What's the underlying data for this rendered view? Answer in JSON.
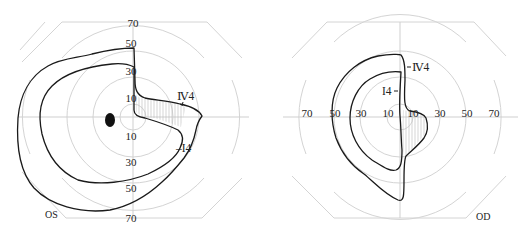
{
  "figure": {
    "type": "Goldmann visual field perimetry",
    "panels": [
      {
        "id": "left",
        "eye_label": "OS",
        "ring_labels_vertical": [
          "70",
          "50",
          "30",
          "10",
          "10",
          "30",
          "50",
          "70"
        ],
        "isopters": [
          {
            "name": "IV4",
            "label": "Ⅳ4"
          },
          {
            "name": "I4",
            "label": "I4"
          }
        ],
        "blind_spot": true
      },
      {
        "id": "right",
        "eye_label": "OD",
        "ring_labels_horizontal": [
          "70",
          "50",
          "30",
          "10",
          "10",
          "30",
          "50",
          "70"
        ],
        "isopters": [
          {
            "name": "IV4",
            "label": "Ⅳ4"
          },
          {
            "name": "I4",
            "label": "I4"
          }
        ],
        "blind_spot": false
      }
    ],
    "colors": {
      "grid": "#d4d4d4",
      "isopter": "#1a1a1a",
      "text": "#222222",
      "background": "#ffffff"
    }
  },
  "left": {
    "eye_label": "OS",
    "ticks": {
      "t70": "70",
      "t50": "50",
      "t30": "30",
      "t10": "10",
      "b10": "10",
      "b30": "30",
      "b50": "50",
      "b70": "70"
    },
    "iv4_label": "Ⅳ4",
    "i4_label": "–I4"
  },
  "right": {
    "eye_label": "OD",
    "ticks": {
      "l70": "70",
      "l50": "50",
      "l30": "30",
      "l10": "10",
      "r10": "10",
      "r30": "30",
      "r50": "50",
      "r70": "70"
    },
    "iv4_label": "Ⅳ4",
    "i4_label": "I4"
  }
}
